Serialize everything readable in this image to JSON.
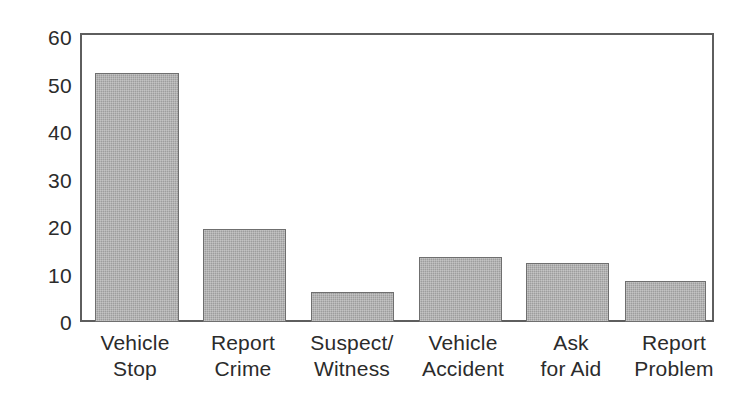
{
  "chart_data": {
    "type": "bar",
    "title": "",
    "subtitle": "",
    "xlabel": "",
    "ylabel": "",
    "ylim": [
      0,
      60
    ],
    "yticks": [
      0,
      10,
      20,
      30,
      40,
      50,
      60
    ],
    "ytick_labels": [
      "0",
      "10",
      "20",
      "30",
      "40",
      "50",
      "60"
    ],
    "grid": false,
    "legend": false,
    "legend_position": "none",
    "orientation": "vertical",
    "categories": [
      "Vehicle Stop",
      "Report Crime",
      "Suspect/ Witness",
      "Vehicle Accident",
      "Ask for Aid",
      "Report Problem"
    ],
    "category_lines": [
      [
        "Vehicle",
        "Stop"
      ],
      [
        "Report",
        "Crime"
      ],
      [
        "Suspect/",
        "Witness"
      ],
      [
        "Vehicle",
        "Accident"
      ],
      [
        "Ask",
        "for Aid"
      ],
      [
        "Report",
        "Problem"
      ]
    ],
    "values": [
      52,
      19.5,
      6.3,
      13.5,
      12.3,
      8.5
    ],
    "bar_color": "#9d9d9d",
    "bar_edge_color": "#6f6f6f",
    "axis_color": "#5e5e5e",
    "text_color": "#2b2b2b",
    "background_color": "#ffffff"
  }
}
